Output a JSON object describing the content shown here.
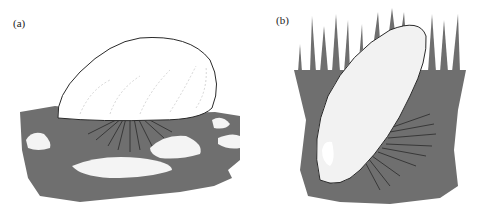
{
  "figure": {
    "panels": [
      {
        "label": "(a)",
        "subject": "epifaunal mussel attached by byssal threads on rocky substrate"
      },
      {
        "label": "(b)",
        "subject": "semi-infaunal mussel partly buried in sediment among vegetation, attached by byssal threads"
      }
    ],
    "colors": {
      "substrate": "#6f6f6f",
      "shell": "#ffffff",
      "outline": "#2a2a2a",
      "rock": "#f4f4f4"
    }
  }
}
